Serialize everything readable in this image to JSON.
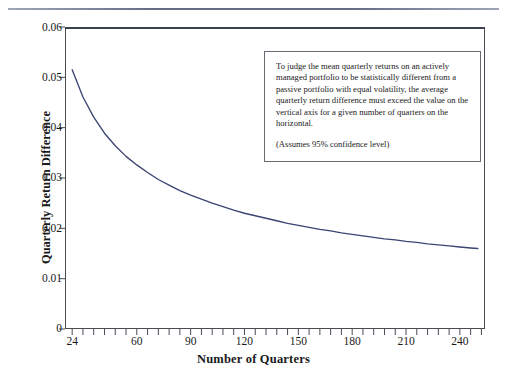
{
  "figure": {
    "top_rule": "horizontal-rule",
    "background_color": "#ffffff"
  },
  "annotation": {
    "paragraph_1": "To judge the mean quarterly returns on an actively managed portfolio to be statistically different from a passive portfolio with equal volatility, the average quarterly return difference must exceed the value on the vertical axis for a given number of quarters on the horizontal.",
    "paragraph_2": "(Assumes 95% confidence level)",
    "border_color": "#6a6a72"
  },
  "chart_data": {
    "type": "line",
    "title": "",
    "xlabel": "Number of Quarters",
    "ylabel": "Quarterly Return Difference",
    "xlim": [
      20,
      254
    ],
    "ylim": [
      0,
      0.06
    ],
    "grid": false,
    "legend": false,
    "line_color": "#3b4472",
    "axis_color": "#4a4a52",
    "x_ticklabels": [
      "24",
      "60",
      "90",
      "120",
      "150",
      "180",
      "210",
      "240"
    ],
    "x_tickvalues": [
      24,
      60,
      90,
      120,
      150,
      180,
      210,
      240
    ],
    "x_minor_tick_step": 6,
    "y_ticklabels": [
      "0",
      "0.01",
      "0.02",
      "0.03",
      "0.04",
      "0.05",
      "0.06"
    ],
    "y_tickvalues": [
      0,
      0.01,
      0.02,
      0.03,
      0.04,
      0.05,
      0.06
    ],
    "series": [
      {
        "name": "Required quarterly return difference",
        "x": [
          24,
          30,
          36,
          42,
          48,
          54,
          60,
          66,
          72,
          78,
          84,
          90,
          96,
          102,
          108,
          114,
          120,
          126,
          132,
          138,
          144,
          150,
          156,
          162,
          168,
          174,
          180,
          186,
          192,
          198,
          204,
          210,
          216,
          222,
          228,
          234,
          240,
          246,
          250
        ],
        "y": [
          0.0515,
          0.0461,
          0.0421,
          0.0389,
          0.0364,
          0.0343,
          0.0326,
          0.0311,
          0.0297,
          0.0286,
          0.0275,
          0.0266,
          0.0258,
          0.025,
          0.0243,
          0.0236,
          0.023,
          0.0225,
          0.022,
          0.0215,
          0.021,
          0.0206,
          0.0202,
          0.0198,
          0.0195,
          0.0191,
          0.0188,
          0.0185,
          0.0182,
          0.0179,
          0.0177,
          0.0174,
          0.0172,
          0.0169,
          0.0167,
          0.0165,
          0.0163,
          0.0161,
          0.016
        ]
      }
    ]
  }
}
